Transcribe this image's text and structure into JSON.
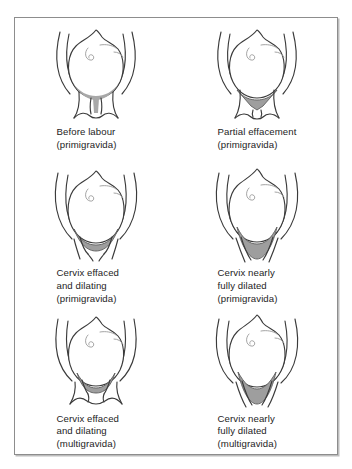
{
  "figure": {
    "border_color": "#8d8d8d",
    "ink_color": "#3b3b3b",
    "shade_color": "#9e9e9e",
    "background_color": "#ffffff",
    "columns": 2,
    "rows": 3,
    "panels": [
      {
        "id": "before-labour-primigravida",
        "stage": "Before labour",
        "parity": "(primigravida)",
        "caption_lines": [
          "Before labour",
          "(primigravida)"
        ],
        "cervix_state": "uneffaced, closed",
        "shading": "thin crescent at internal os",
        "canal": "long closed canal with external os"
      },
      {
        "id": "partial-effacement-primigravida",
        "stage": "Partial effacement",
        "parity": "(primigravida)",
        "caption_lines": [
          "Partial effacement",
          "(primigravida)"
        ],
        "cervix_state": "partially effaced",
        "shading": "inverted triangular funnel",
        "canal": "shortened canal, external os closed"
      },
      {
        "id": "effaced-dilating-primigravida",
        "stage": "Cervix effaced and dilating",
        "parity": "(primigravida)",
        "caption_lines": [
          "Cervix effaced",
          "and dilating",
          "(primigravida)"
        ],
        "cervix_state": "fully effaced, dilating",
        "shading": "broad shallow wedge",
        "canal": "no canal, open os"
      },
      {
        "id": "nearly-fully-dilated-primigravida",
        "stage": "Cervix nearly fully dilated",
        "parity": "(primigravida)",
        "caption_lines": [
          "Cervix nearly",
          "fully dilated",
          "(primigravida)"
        ],
        "cervix_state": "nearly fully dilated",
        "shading": "deep tapering wedge",
        "canal": "wide open os"
      },
      {
        "id": "effaced-dilating-multigravida",
        "stage": "Cervix effaced and dilating",
        "parity": "(multigravida)",
        "caption_lines": [
          "Cervix effaced",
          "and dilating",
          "(multigravida)"
        ],
        "cervix_state": "effaced, dilating",
        "shading": "shallow band",
        "canal": "splayed flared cervical walls"
      },
      {
        "id": "nearly-fully-dilated-multigravida",
        "stage": "Cervix nearly fully dilated",
        "parity": "(multigravida)",
        "caption_lines": [
          "Cervix nearly",
          "fully dilated",
          "(multigravida)"
        ],
        "cervix_state": "nearly fully dilated",
        "shading": "deep tapering wedge",
        "canal": "wide flared walls"
      }
    ]
  }
}
